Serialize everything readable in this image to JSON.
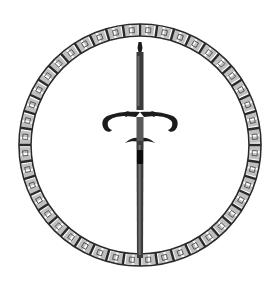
{
  "image": {
    "subject": "Sword within a chain-link ring emblem",
    "width": 279,
    "height": 285
  },
  "emblem": {
    "ring": {
      "cx": 140,
      "cy": 145,
      "r": 115,
      "thickness": 12,
      "links": 44,
      "color": "#2a2a2a"
    },
    "sword": {
      "color": "#1e1e1e",
      "blade": {
        "x": 140,
        "top": 42,
        "bottom": 258,
        "width": 7
      },
      "crossguard": {
        "y": 118,
        "left": 102,
        "right": 178
      }
    }
  }
}
